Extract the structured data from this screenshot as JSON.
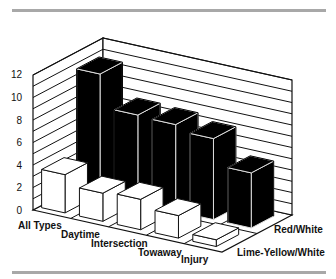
{
  "chart_data": {
    "type": "bar",
    "subtype": "3d-grouped-bar",
    "title": "",
    "xlabel": "",
    "ylabel": "",
    "ylim": [
      0,
      12
    ],
    "yticks": [
      0,
      2,
      4,
      6,
      8,
      10,
      12
    ],
    "grid": true,
    "categories": [
      "All Types",
      "Daytime",
      "Intersection",
      "Towaway",
      "Injury"
    ],
    "series": [
      {
        "name": "Red/White",
        "color": "#000000",
        "values": [
          10.7,
          7.8,
          7.7,
          7.2,
          4.9
        ]
      },
      {
        "name": "Lime-Yellow/White",
        "color": "#ffffff",
        "values": [
          3.4,
          2.5,
          2.7,
          2.0,
          0.6
        ]
      }
    ],
    "legend_position": "depth-axis labels at right"
  },
  "labels": {
    "yticks": [
      "0",
      "2",
      "4",
      "6",
      "8",
      "10",
      "12"
    ],
    "categories": [
      "All Types",
      "Daytime",
      "Intersection",
      "Towaway",
      "Injury"
    ],
    "series": [
      "Red/White",
      "Lime-Yellow/White"
    ]
  }
}
